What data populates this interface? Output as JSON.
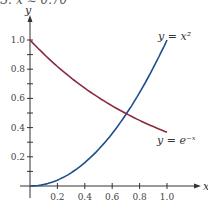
{
  "caption": "S: x ≈ 0.70",
  "chart_data": {
    "type": "line",
    "title": "",
    "xlabel": "x",
    "ylabel": "y",
    "xlim": [
      0,
      1.0
    ],
    "ylim": [
      0,
      1.0
    ],
    "x_ticks": [
      "0.2",
      "0.4",
      "0.6",
      "0.8",
      "1.0"
    ],
    "y_ticks": [
      "0.2",
      "0.4",
      "0.6",
      "0.8",
      "1.0"
    ],
    "grid": false,
    "series": [
      {
        "name": "y = x^2",
        "label": "y = x²",
        "color": "#1f4e8c",
        "x": [
          0,
          0.1,
          0.2,
          0.3,
          0.4,
          0.5,
          0.6,
          0.7,
          0.8,
          0.9,
          1.0
        ],
        "values": [
          0,
          0.01,
          0.04,
          0.09,
          0.16,
          0.25,
          0.36,
          0.49,
          0.64,
          0.81,
          1.0
        ]
      },
      {
        "name": "y = e^-x",
        "label": "y = e⁻ˣ",
        "color": "#8b2a3c",
        "x": [
          0,
          0.1,
          0.2,
          0.3,
          0.4,
          0.5,
          0.6,
          0.7,
          0.8,
          0.9,
          1.0
        ],
        "values": [
          1.0,
          0.905,
          0.819,
          0.741,
          0.67,
          0.607,
          0.549,
          0.497,
          0.449,
          0.407,
          0.368
        ]
      }
    ],
    "annotations": [
      "y = x²",
      "y = e⁻ˣ"
    ]
  }
}
